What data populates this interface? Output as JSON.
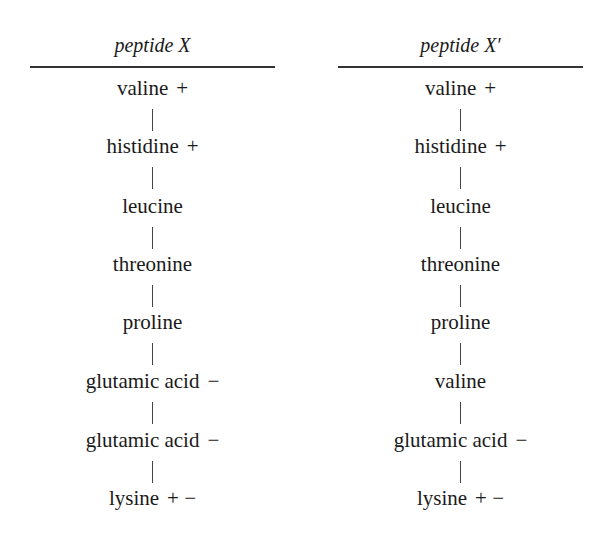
{
  "columns": [
    {
      "title": "peptide X",
      "residues": [
        {
          "name": "valine",
          "charge": "+"
        },
        {
          "name": "histidine",
          "charge": "+"
        },
        {
          "name": "leucine",
          "charge": ""
        },
        {
          "name": "threonine",
          "charge": ""
        },
        {
          "name": "proline",
          "charge": ""
        },
        {
          "name": "glutamic acid",
          "charge": "−"
        },
        {
          "name": "glutamic acid",
          "charge": "−"
        },
        {
          "name": "lysine",
          "charge": "+ −"
        }
      ]
    },
    {
      "title": "peptide X′",
      "residues": [
        {
          "name": "valine",
          "charge": "+"
        },
        {
          "name": "histidine",
          "charge": "+"
        },
        {
          "name": "leucine",
          "charge": ""
        },
        {
          "name": "threonine",
          "charge": ""
        },
        {
          "name": "proline",
          "charge": ""
        },
        {
          "name": "valine",
          "charge": ""
        },
        {
          "name": "glutamic acid",
          "charge": "−"
        },
        {
          "name": "lysine",
          "charge": "+ −"
        }
      ]
    }
  ]
}
